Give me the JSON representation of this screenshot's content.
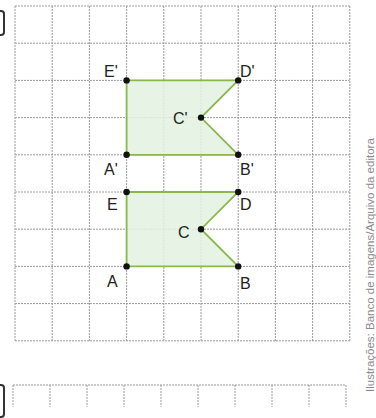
{
  "figure": {
    "grid": {
      "columns": 9,
      "rows": 9,
      "origin_px": [
        15,
        6
      ],
      "cell_px": 37.2,
      "line_color": "#9a9a9a"
    },
    "second_grid": {
      "columns": 9,
      "origin_px": [
        13,
        385
      ],
      "cell_px": 37
    },
    "shape_style": {
      "fill": "#e3f1df",
      "stroke": "#8ab84a",
      "point_color": "#111111"
    },
    "shapes": [
      {
        "name": "original",
        "vertices": [
          {
            "label": "A",
            "grid": [
              3,
              7
            ]
          },
          {
            "label": "B",
            "grid": [
              6,
              7
            ]
          },
          {
            "label": "C",
            "grid": [
              5,
              6
            ]
          },
          {
            "label": "D",
            "grid": [
              6,
              5
            ]
          },
          {
            "label": "E",
            "grid": [
              3,
              5
            ]
          }
        ]
      },
      {
        "name": "image",
        "vertices": [
          {
            "label": "A'",
            "grid": [
              3,
              4
            ]
          },
          {
            "label": "B'",
            "grid": [
              6,
              4
            ]
          },
          {
            "label": "C'",
            "grid": [
              5,
              3
            ]
          },
          {
            "label": "D'",
            "grid": [
              6,
              2
            ]
          },
          {
            "label": "E'",
            "grid": [
              3,
              2
            ]
          }
        ]
      }
    ],
    "labels": {
      "A": "A",
      "B": "B",
      "C": "C",
      "D": "D",
      "E": "E",
      "A_prime": "A'",
      "B_prime": "B'",
      "C_prime": "C'",
      "D_prime": "D'",
      "E_prime": "E'"
    }
  },
  "credit": "Ilustrações: Banco de imagens/Arquivo da editora"
}
